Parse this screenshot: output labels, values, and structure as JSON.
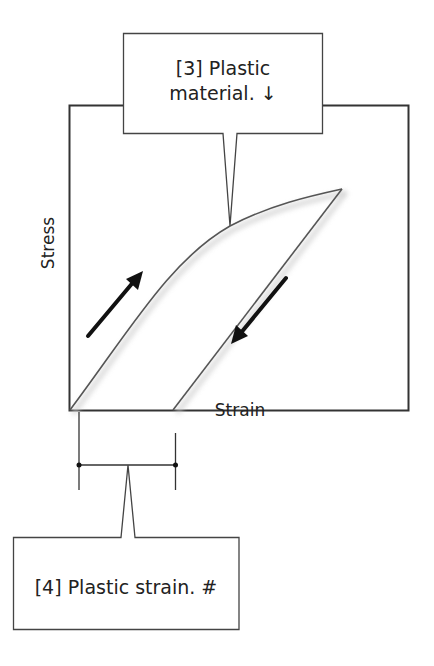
{
  "diagram": {
    "colors": {
      "stroke": "#333333",
      "curve": "#555555",
      "arrow": "#111111",
      "background": "#ffffff"
    },
    "axes": {
      "x_label": "Strain",
      "y_label": "Stress"
    },
    "callouts": [
      {
        "id": 3,
        "line1": "[3] Plastic",
        "line2": "material. ↓",
        "points_to": "loading-curve"
      },
      {
        "id": 4,
        "line1": "[4] Plastic strain. #",
        "points_to": "plastic-strain-bracket"
      }
    ],
    "curves": [
      {
        "name": "loading-curve",
        "direction": "up",
        "description": "Concave-down loading path from origin to peak"
      },
      {
        "name": "unloading-line",
        "direction": "down",
        "description": "Straight unloading path from peak back to strain axis"
      }
    ],
    "arrows": [
      {
        "name": "loading-arrow",
        "direction": "up-right"
      },
      {
        "name": "unloading-arrow",
        "direction": "down-left"
      }
    ]
  }
}
